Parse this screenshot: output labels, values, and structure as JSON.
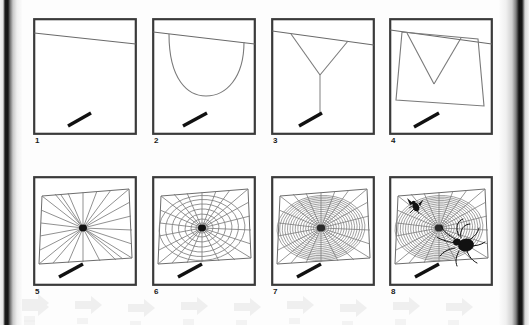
{
  "figure": {
    "kind": "diagram",
    "panel_count": 8,
    "rows": 2,
    "columns": 4,
    "background_color": "#fdfdfd",
    "ink_color": "#5a5a5a",
    "frame_color": "#3a3a3a",
    "solid_black": "#111111"
  },
  "watermark": {
    "name": "arrow-watermark",
    "shape": "right-pointing-arrow",
    "repeat_count": 9,
    "color": "#e3e3e3"
  },
  "panels": [
    {
      "label": "1",
      "name": "panel-bridge-thread",
      "caption": "Bridge thread spanning the gap",
      "elements": [
        "bridge-line",
        "twig"
      ]
    },
    {
      "label": "2",
      "name": "panel-hanging-loop",
      "caption": "Loose thread hangs in a U-shaped loop",
      "elements": [
        "bridge-line",
        "hanging-loop",
        "twig"
      ]
    },
    {
      "label": "3",
      "name": "panel-y-frame",
      "caption": "Y-shaped frame with drop line to anchor",
      "elements": [
        "bridge-line",
        "y-fork",
        "drop-line",
        "twig"
      ]
    },
    {
      "label": "4",
      "name": "panel-outer-frame",
      "caption": "Outer frame threads completed",
      "elements": [
        "bridge-line",
        "frame-quad",
        "y-fork",
        "twig"
      ]
    },
    {
      "label": "5",
      "name": "panel-radii",
      "caption": "Radial spokes laid from hub to frame",
      "elements": [
        "frame-quad",
        "radii",
        "hub",
        "twig"
      ],
      "radius_count": 24
    },
    {
      "label": "6",
      "name": "panel-auxiliary-spiral",
      "caption": "Widely spaced auxiliary spiral added",
      "elements": [
        "frame-quad",
        "radii",
        "auxiliary-spiral",
        "hub",
        "twig"
      ],
      "ring_count": 8
    },
    {
      "label": "7",
      "name": "panel-capture-spiral",
      "caption": "Dense sticky capture spiral fills the web",
      "elements": [
        "frame-quad",
        "radii",
        "capture-spiral",
        "hub",
        "twig"
      ],
      "ring_count": 17
    },
    {
      "label": "8",
      "name": "panel-spider-and-prey",
      "caption": "Finished web with spider and captured fly",
      "elements": [
        "frame-quad",
        "radii",
        "capture-spiral",
        "hub",
        "spider",
        "fly",
        "twig"
      ],
      "ring_count": 17,
      "creatures": [
        {
          "name": "fly",
          "position": "upper-left"
        },
        {
          "name": "spider",
          "position": "lower-right"
        }
      ]
    }
  ]
}
